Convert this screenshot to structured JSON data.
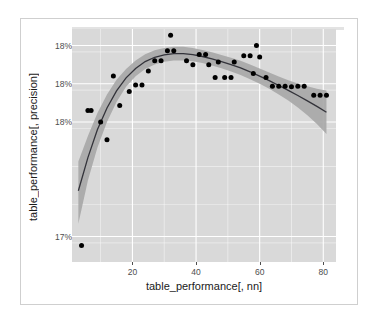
{
  "figure": {
    "background_color": "#ffffff",
    "frame_color": "#cfcfcf",
    "panel_color": "#d9d9d9",
    "gridline_color": "#ffffff",
    "band_color": "#a8a8a8",
    "line_color": "#33333a",
    "point_color": "#000000"
  },
  "chart_data": {
    "type": "scatter",
    "title": "",
    "subtitle": "",
    "xlabel": "table_performance[, nn]",
    "ylabel": "table_performance[, precision]",
    "xlim": [
      1,
      84
    ],
    "ylim": [
      0.1715,
      0.18065
    ],
    "xticks": [
      20,
      40,
      60,
      80
    ],
    "xticklabels": [
      "20",
      "40",
      "60",
      "80"
    ],
    "yticks": [
      0.18,
      0.1785,
      0.177,
      0.1725
    ],
    "yticklabels": [
      "18%",
      "18%",
      "18%",
      "17%"
    ],
    "grid": true,
    "grid_minor": true,
    "legend": null,
    "legend_position": "none",
    "annotations": [],
    "series": [
      {
        "name": "observations",
        "type": "scatter",
        "marker": "filled-circle",
        "color": "#000000",
        "points": [
          {
            "x": 4,
            "y": 0.17215
          },
          {
            "x": 6,
            "y": 0.17745
          },
          {
            "x": 7,
            "y": 0.17745
          },
          {
            "x": 10,
            "y": 0.177
          },
          {
            "x": 12,
            "y": 0.1763
          },
          {
            "x": 14,
            "y": 0.1788
          },
          {
            "x": 16,
            "y": 0.17765
          },
          {
            "x": 19,
            "y": 0.1782
          },
          {
            "x": 21,
            "y": 0.17845
          },
          {
            "x": 23,
            "y": 0.17845
          },
          {
            "x": 25,
            "y": 0.179
          },
          {
            "x": 27,
            "y": 0.1794
          },
          {
            "x": 29,
            "y": 0.1794
          },
          {
            "x": 31,
            "y": 0.1798
          },
          {
            "x": 32,
            "y": 0.1804
          },
          {
            "x": 33,
            "y": 0.1798
          },
          {
            "x": 37,
            "y": 0.1794
          },
          {
            "x": 39,
            "y": 0.17925
          },
          {
            "x": 41,
            "y": 0.17965
          },
          {
            "x": 43,
            "y": 0.17965
          },
          {
            "x": 44,
            "y": 0.17925
          },
          {
            "x": 46,
            "y": 0.17875
          },
          {
            "x": 47,
            "y": 0.17935
          },
          {
            "x": 49,
            "y": 0.17875
          },
          {
            "x": 51,
            "y": 0.17875
          },
          {
            "x": 52,
            "y": 0.17935
          },
          {
            "x": 55,
            "y": 0.1796
          },
          {
            "x": 57,
            "y": 0.1796
          },
          {
            "x": 58,
            "y": 0.1789
          },
          {
            "x": 59,
            "y": 0.18
          },
          {
            "x": 60,
            "y": 0.17955
          },
          {
            "x": 62,
            "y": 0.17875
          },
          {
            "x": 64,
            "y": 0.1784
          },
          {
            "x": 66,
            "y": 0.1784
          },
          {
            "x": 68,
            "y": 0.1784
          },
          {
            "x": 70,
            "y": 0.17838
          },
          {
            "x": 72,
            "y": 0.1784
          },
          {
            "x": 74,
            "y": 0.1784
          },
          {
            "x": 77,
            "y": 0.17805
          },
          {
            "x": 79,
            "y": 0.17805
          },
          {
            "x": 81,
            "y": 0.17805
          }
        ]
      },
      {
        "name": "loess-smooth",
        "type": "line",
        "color": "#33333a",
        "confidence_band": true,
        "band_color": "#a8a8a8",
        "fit": [
          {
            "x": 3,
            "y": 0.1743,
            "lo": 0.173,
            "hi": 0.17545
          },
          {
            "x": 6,
            "y": 0.1756,
            "lo": 0.1747,
            "hi": 0.17645
          },
          {
            "x": 9,
            "y": 0.1767,
            "lo": 0.176,
            "hi": 0.17735
          },
          {
            "x": 12,
            "y": 0.17755,
            "lo": 0.177,
            "hi": 0.17808
          },
          {
            "x": 15,
            "y": 0.17822,
            "lo": 0.17778,
            "hi": 0.17866
          },
          {
            "x": 18,
            "y": 0.17873,
            "lo": 0.17838,
            "hi": 0.17908
          },
          {
            "x": 21,
            "y": 0.1791,
            "lo": 0.17879,
            "hi": 0.17941
          },
          {
            "x": 24,
            "y": 0.17937,
            "lo": 0.17908,
            "hi": 0.17966
          },
          {
            "x": 27,
            "y": 0.17954,
            "lo": 0.17926,
            "hi": 0.17982
          },
          {
            "x": 30,
            "y": 0.17963,
            "lo": 0.17936,
            "hi": 0.1799
          },
          {
            "x": 33,
            "y": 0.17968,
            "lo": 0.17941,
            "hi": 0.17995
          },
          {
            "x": 36,
            "y": 0.17968,
            "lo": 0.17941,
            "hi": 0.17995
          },
          {
            "x": 39,
            "y": 0.17964,
            "lo": 0.17938,
            "hi": 0.1799
          },
          {
            "x": 42,
            "y": 0.17957,
            "lo": 0.17931,
            "hi": 0.17983
          },
          {
            "x": 45,
            "y": 0.17948,
            "lo": 0.17922,
            "hi": 0.17974
          },
          {
            "x": 48,
            "y": 0.17937,
            "lo": 0.17911,
            "hi": 0.17963
          },
          {
            "x": 51,
            "y": 0.17925,
            "lo": 0.17898,
            "hi": 0.17952
          },
          {
            "x": 54,
            "y": 0.17912,
            "lo": 0.17884,
            "hi": 0.1794
          },
          {
            "x": 57,
            "y": 0.17897,
            "lo": 0.17868,
            "hi": 0.17926
          },
          {
            "x": 60,
            "y": 0.1788,
            "lo": 0.1785,
            "hi": 0.1791
          },
          {
            "x": 63,
            "y": 0.17862,
            "lo": 0.1783,
            "hi": 0.17894
          },
          {
            "x": 66,
            "y": 0.17843,
            "lo": 0.17808,
            "hi": 0.17878
          },
          {
            "x": 69,
            "y": 0.17824,
            "lo": 0.17784,
            "hi": 0.17864
          },
          {
            "x": 72,
            "y": 0.17804,
            "lo": 0.17757,
            "hi": 0.17851
          },
          {
            "x": 75,
            "y": 0.17783,
            "lo": 0.17726,
            "hi": 0.1784
          },
          {
            "x": 78,
            "y": 0.17761,
            "lo": 0.17692,
            "hi": 0.1783
          },
          {
            "x": 81,
            "y": 0.17738,
            "lo": 0.17653,
            "hi": 0.17823
          }
        ]
      }
    ]
  }
}
